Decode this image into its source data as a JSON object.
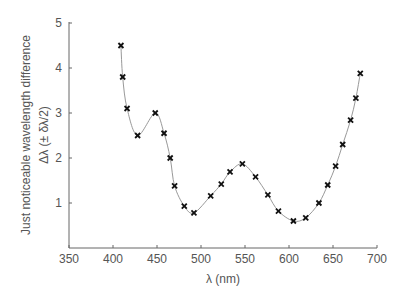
{
  "chart_data": {
    "type": "scatter",
    "title": "",
    "xlabel": "λ (nm)",
    "ylabel": "Just noticeable wavelength difference",
    "ylabel2": "Δλ (± δλ/2)",
    "xlim": [
      350,
      700
    ],
    "ylim": [
      0,
      5
    ],
    "xticks": [
      350,
      400,
      450,
      500,
      550,
      600,
      650,
      700
    ],
    "yticks": [
      1,
      2,
      3,
      4,
      5
    ],
    "grid": false,
    "series": [
      {
        "name": "measurements",
        "marker": "x",
        "line": "smooth curve",
        "x": [
          409,
          411,
          416,
          428,
          448,
          458,
          465,
          470,
          481,
          492,
          511,
          523,
          533,
          547,
          562,
          576,
          588,
          605,
          619,
          634,
          644,
          653,
          661,
          670,
          676,
          681
        ],
        "values": [
          4.5,
          3.8,
          3.1,
          2.5,
          3.0,
          2.55,
          2.0,
          1.38,
          0.93,
          0.78,
          1.16,
          1.42,
          1.69,
          1.87,
          1.58,
          1.18,
          0.82,
          0.6,
          0.67,
          1.0,
          1.4,
          1.82,
          2.3,
          2.84,
          3.33,
          3.88
        ]
      }
    ]
  }
}
